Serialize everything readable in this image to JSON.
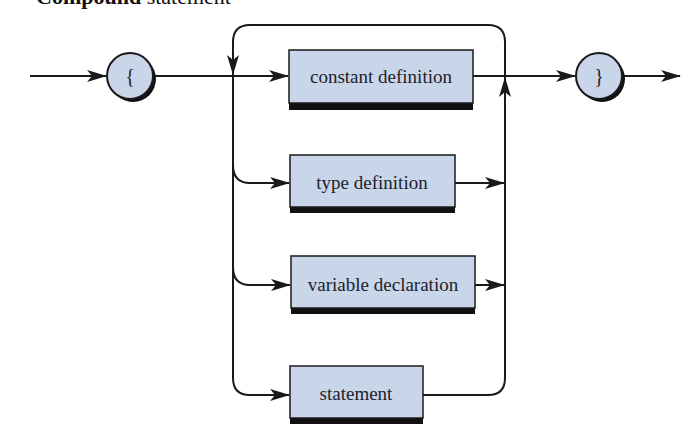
{
  "title": {
    "bold": "Compound",
    "regular": "statement"
  },
  "colors": {
    "box_fill": "#c9d5e8",
    "line": "#1a1a1a",
    "shadow": "#111111",
    "background": "#ffffff"
  },
  "terminals": {
    "open": {
      "label": "{"
    },
    "close": {
      "label": "}"
    }
  },
  "nodes": [
    {
      "label": "constant definition"
    },
    {
      "label": "type definition"
    },
    {
      "label": "variable declaration"
    },
    {
      "label": "statement"
    }
  ]
}
